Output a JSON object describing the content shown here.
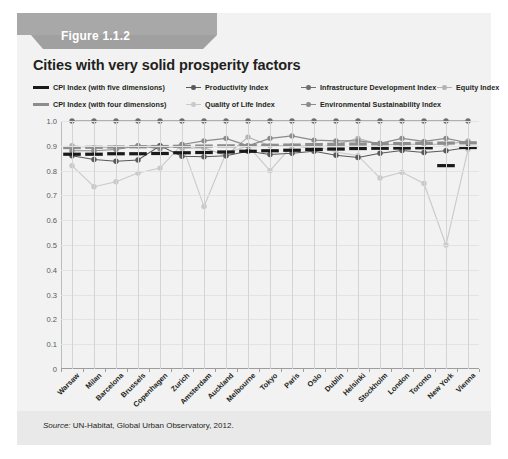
{
  "figure": {
    "badge_label": "Figure 1.1.2",
    "title": "Cities with very solid prosperity factors",
    "source_prefix": "Source:",
    "source_text": " UN-Habitat, Global Urban Observatory, 2012."
  },
  "colors": {
    "cpi_five": "#1a1a1a",
    "cpi_four": "#8d8d8d",
    "productivity": "#58595b",
    "quality_of_life": "#c9c9c9",
    "infrastructure": "#6e6f71",
    "environmental": "#8a8b8d",
    "equity": "#b3b3b3",
    "grid": "#d4d4d4",
    "card_bg": "#f2f2f2",
    "badge": "#9c9c9c"
  },
  "legend": {
    "items": [
      {
        "label": "CPI Index (with five dimensions)",
        "marker": "bar",
        "color": "#1a1a1a",
        "row": 0,
        "col": 0
      },
      {
        "label": "Productivity Index",
        "marker": "point",
        "color": "#58595b",
        "row": 0,
        "col": 1
      },
      {
        "label": "Infrastructure Development Index",
        "marker": "point",
        "color": "#6e6f71",
        "row": 0,
        "col": 2
      },
      {
        "label": "Equity Index",
        "marker": "point",
        "color": "#b3b3b3",
        "row": 0,
        "col": 3
      },
      {
        "label": "CPI Index (with four dimensions)",
        "marker": "bar",
        "color": "#8d8d8d",
        "row": 1,
        "col": 0
      },
      {
        "label": "Quality of Life Index",
        "marker": "point",
        "color": "#c9c9c9",
        "row": 1,
        "col": 1
      },
      {
        "label": "Environmental Sustainability Index",
        "marker": "point",
        "color": "#8a8b8d",
        "row": 1,
        "col": 2
      }
    ]
  },
  "chart_data": {
    "type": "line",
    "title": "Cities with very solid prosperity factors",
    "xlabel": "",
    "ylabel": "",
    "ylim": [
      0,
      1.0
    ],
    "ytick_labels": [
      "0",
      "0.1",
      "0.2",
      "0.3",
      "0.4",
      "0.5",
      "0.6",
      "0.7",
      "0.8",
      "0.9",
      "1.0"
    ],
    "yticks": [
      0,
      0.1,
      0.2,
      0.3,
      0.4,
      0.5,
      0.6,
      0.7,
      0.8,
      0.9,
      1.0
    ],
    "grid": true,
    "legend_position": "top",
    "categories": [
      "Warsaw",
      "Milan",
      "Barcelona",
      "Brussels",
      "Copenhagen",
      "Zurich",
      "Amsterdam",
      "Auckland",
      "Melbourne",
      "Tokyo",
      "Paris",
      "Oslo",
      "Dublin",
      "Helsinki",
      "Stockholm",
      "London",
      "Toronto",
      "New York",
      "Vienna"
    ],
    "series": [
      {
        "name": "CPI Index (with five dimensions)",
        "style": "bar",
        "color": "#1a1a1a",
        "values": [
          0.866,
          0.866,
          0.868,
          0.868,
          0.869,
          0.872,
          0.873,
          0.875,
          0.878,
          0.88,
          0.882,
          0.885,
          0.887,
          0.889,
          0.89,
          0.891,
          0.892,
          0.82,
          0.893
        ]
      },
      {
        "name": "CPI Index (with four dimensions)",
        "style": "bar",
        "color": "#8d8d8d",
        "values": [
          0.893,
          0.894,
          0.895,
          0.896,
          0.897,
          0.898,
          0.899,
          0.9,
          0.901,
          0.902,
          0.903,
          0.905,
          0.906,
          0.907,
          0.908,
          0.909,
          0.91,
          0.911,
          0.912
        ]
      },
      {
        "name": "Productivity Index",
        "style": "point",
        "color": "#58595b",
        "values": [
          0.86,
          0.845,
          0.838,
          0.843,
          0.9,
          0.858,
          0.856,
          0.86,
          0.878,
          0.865,
          0.87,
          0.878,
          0.862,
          0.853,
          0.87,
          0.881,
          0.873,
          0.88,
          0.893
        ]
      },
      {
        "name": "Infrastructure Development Index",
        "style": "point",
        "color": "#6e6f71",
        "values": [
          1.0,
          1.0,
          1.0,
          1.0,
          1.0,
          1.0,
          1.0,
          1.0,
          1.0,
          1.0,
          1.0,
          1.0,
          1.0,
          1.0,
          1.0,
          1.0,
          1.0,
          1.0,
          1.0
        ]
      },
      {
        "name": "Equity Index",
        "style": "point",
        "color": "#b3b3b3",
        "values": [
          0.9,
          0.892,
          0.893,
          0.9,
          0.9,
          0.89,
          0.892,
          0.86,
          0.935,
          0.9,
          0.9,
          0.89,
          0.905,
          0.93,
          0.905,
          0.905,
          0.907,
          0.905,
          0.92
        ]
      },
      {
        "name": "Environmental Sustainability Index",
        "style": "point",
        "color": "#8a8b8d",
        "values": [
          0.88,
          0.88,
          0.885,
          0.9,
          0.888,
          0.905,
          0.92,
          0.93,
          0.9,
          0.93,
          0.94,
          0.923,
          0.92,
          0.92,
          0.91,
          0.93,
          0.918,
          0.93,
          0.912
        ]
      },
      {
        "name": "Quality of Life Index",
        "style": "point",
        "color": "#c9c9c9",
        "values": [
          0.82,
          0.735,
          0.755,
          0.79,
          0.81,
          0.905,
          0.655,
          0.87,
          0.9,
          0.8,
          0.9,
          0.9,
          0.875,
          0.86,
          0.77,
          0.793,
          0.748,
          0.5,
          0.885
        ]
      }
    ]
  }
}
